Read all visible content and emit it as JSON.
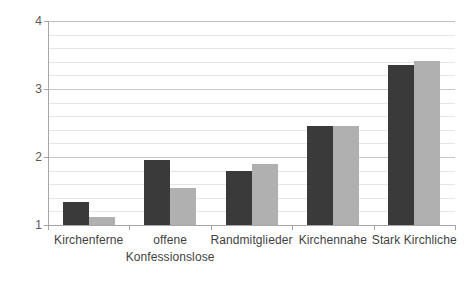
{
  "chart_data": {
    "type": "bar",
    "title": "",
    "subtitle": "",
    "xlabel": "",
    "ylabel": "",
    "ylim": [
      1,
      4
    ],
    "y_ticks": [
      1,
      2,
      3,
      4
    ],
    "y_tick_labels": [
      "1",
      "2",
      "3",
      "4"
    ],
    "minor_gridline_step": 0.2,
    "grid": true,
    "legend": false,
    "legend_position": "none",
    "categories": [
      "Kirchenferne",
      "offene Konfessionslose",
      "Randmitglieder",
      "Kirchennahe",
      "Stark Kirchliche"
    ],
    "category_lines": [
      [
        "Kirchenferne"
      ],
      [
        "offene",
        "Konfessionslose"
      ],
      [
        "Randmitglieder"
      ],
      [
        "Kirchennahe"
      ],
      [
        "Stark Kirchliche"
      ]
    ],
    "series": [
      {
        "name": "Serie 1",
        "color": "#3a3a3a",
        "values": [
          1.34,
          1.96,
          1.8,
          2.45,
          3.35
        ]
      },
      {
        "name": "Serie 2",
        "color": "#b0b0b0",
        "values": [
          1.12,
          1.54,
          1.9,
          2.45,
          3.41
        ]
      }
    ],
    "colors": {
      "series_a": "#3a3a3a",
      "series_b": "#b0b0b0",
      "gridline": "#e6e6e6",
      "major_gridline": "#c8c8c8",
      "axis": "#a6a6a6",
      "tick_text": "#595959",
      "label_text": "#3f3f3f",
      "background": "#ffffff"
    }
  }
}
